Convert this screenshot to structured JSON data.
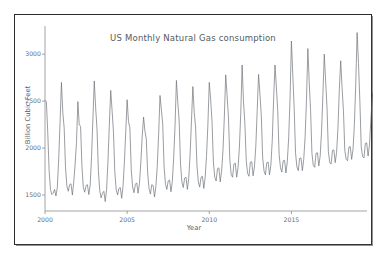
{
  "chart_data": {
    "type": "line",
    "title": "US Monthly Natural Gas consumption",
    "xlabel": "Year",
    "ylabel": "Billion Cubic Feet",
    "grid": false,
    "legend": null,
    "line_color": "#6e7278",
    "xlim": [
      2000.0,
      2019.6
    ],
    "ylim": [
      1330,
      3300
    ],
    "yticks": [
      1500,
      2000,
      2500,
      3000
    ],
    "ytick_labels": [
      "1500",
      "2000",
      "2500",
      "3000"
    ],
    "xticks": [
      2000,
      2005,
      2010,
      2015
    ],
    "xtick_labels": [
      "2000",
      "2005",
      "2010",
      "2015"
    ],
    "x_start": 2000.0,
    "x_step": 0.08333,
    "series": [
      {
        "name": "US Monthly Natural Gas consumption",
        "values": [
          2510,
          2495,
          2170,
          1760,
          1560,
          1505,
          1520,
          1560,
          1490,
          1580,
          1880,
          2270,
          2700,
          2380,
          2215,
          1790,
          1595,
          1540,
          1610,
          1620,
          1500,
          1640,
          1830,
          2060,
          2495,
          2250,
          2230,
          1800,
          1580,
          1530,
          1600,
          1610,
          1505,
          1605,
          1910,
          2310,
          2715,
          2430,
          2200,
          1760,
          1545,
          1470,
          1520,
          1540,
          1430,
          1560,
          1860,
          2250,
          2615,
          2400,
          2175,
          1745,
          1560,
          1500,
          1570,
          1580,
          1465,
          1595,
          1850,
          2180,
          2515,
          2280,
          2215,
          1770,
          1585,
          1525,
          1615,
          1630,
          1520,
          1625,
          1845,
          2125,
          2330,
          2180,
          2095,
          1735,
          1570,
          1510,
          1610,
          1600,
          1480,
          1590,
          1805,
          2145,
          2560,
          2410,
          2255,
          1800,
          1615,
          1560,
          1650,
          1660,
          1535,
          1645,
          1900,
          2240,
          2720,
          2490,
          2290,
          1830,
          1640,
          1580,
          1680,
          1690,
          1560,
          1680,
          1935,
          2290,
          2655,
          2380,
          2225,
          1815,
          1640,
          1585,
          1690,
          1700,
          1570,
          1690,
          1920,
          2255,
          2700,
          2520,
          2280,
          1855,
          1690,
          1650,
          1780,
          1790,
          1640,
          1755,
          1975,
          2330,
          2780,
          2560,
          2330,
          1880,
          1720,
          1690,
          1830,
          1840,
          1690,
          1790,
          2010,
          2375,
          2885,
          2490,
          2265,
          1865,
          1730,
          1700,
          1850,
          1855,
          1705,
          1800,
          2020,
          2400,
          2785,
          2580,
          2340,
          1900,
          1755,
          1715,
          1845,
          1850,
          1715,
          1820,
          2080,
          2520,
          2885,
          2650,
          2400,
          1935,
          1790,
          1745,
          1865,
          1870,
          1735,
          1855,
          2110,
          2530,
          3140,
          2780,
          2430,
          1950,
          1800,
          1760,
          1890,
          1895,
          1760,
          1880,
          2120,
          2510,
          3060,
          2700,
          2400,
          1945,
          1815,
          1795,
          1945,
          1950,
          1810,
          1915,
          2175,
          2570,
          3000,
          2715,
          2435,
          1960,
          1845,
          1830,
          1975,
          1980,
          1845,
          1955,
          2215,
          2630,
          2930,
          2645,
          2400,
          1975,
          1880,
          1865,
          2010,
          2015,
          1880,
          1985,
          2250,
          2690,
          3230,
          2900,
          2500,
          2010,
          1910,
          1895,
          2050,
          2055,
          1915,
          2030,
          2290,
          2540,
          2610
        ]
      }
    ]
  }
}
